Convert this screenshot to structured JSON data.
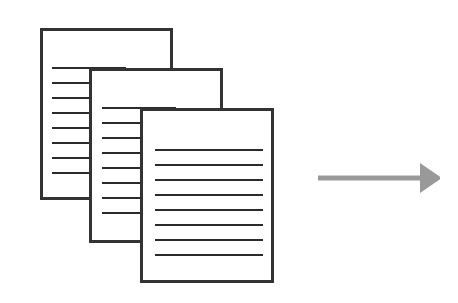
{
  "figure": {
    "title": "Stack of lined documents with a right-pointing arrow",
    "type": "diagram",
    "canvas": {
      "width": 458,
      "height": 303,
      "background": "#ffffff"
    }
  },
  "style": {
    "page_border_color": "#333333",
    "page_fill_color": "#ffffff",
    "page_border_width": 3,
    "rule_line_color": "#2b2b2b",
    "rule_line_height": 2,
    "arrow_color": "#999999"
  },
  "documents": [
    {
      "name": "document-back",
      "label": "Back document",
      "x": 40,
      "y": 28,
      "width": 133,
      "height": 172,
      "lines": {
        "count": 8,
        "first_y": 67,
        "spacing": 15,
        "x": 52,
        "width": 74
      }
    },
    {
      "name": "document-middle",
      "label": "Middle document",
      "x": 89,
      "y": 68,
      "width": 134,
      "height": 175,
      "lines": {
        "count": 8,
        "first_y": 107,
        "spacing": 15,
        "x": 102,
        "width": 74
      }
    },
    {
      "name": "document-front",
      "label": "Front document",
      "x": 140,
      "y": 108,
      "width": 134,
      "height": 175,
      "lines": {
        "count": 8,
        "first_y": 149,
        "spacing": 15,
        "x": 155,
        "width": 108
      }
    }
  ],
  "arrow": {
    "name": "process-arrow",
    "label": "Right-pointing arrow",
    "direction": "right",
    "color": "#999999",
    "x": 318,
    "y": 162,
    "width": 122,
    "height": 32,
    "shaft_length": 102,
    "shaft_thickness": 5,
    "head_length": 22,
    "head_width": 30
  }
}
